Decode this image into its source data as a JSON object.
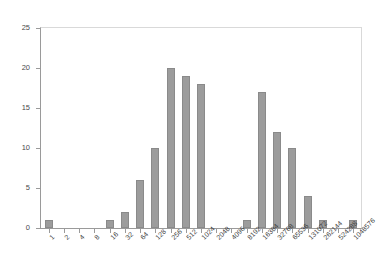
{
  "chart_data": {
    "type": "bar",
    "title": "",
    "subtitle": "",
    "xlabel": "",
    "ylabel": "",
    "ylim": [
      0,
      25
    ],
    "ytick_step": 5,
    "yticks": [
      "0",
      "5",
      "10",
      "15",
      "20",
      "25"
    ],
    "grid": false,
    "legend": false,
    "legend_position": "none",
    "bar_color": "#9c9c9c",
    "bar_border_color": "#8a8a8a",
    "axis_color": "#9a9a9a",
    "plot_border_color": "#d9d9d9",
    "categories": [
      "1",
      "2",
      "4",
      "8",
      "16",
      "32",
      "64",
      "128",
      "256",
      "512",
      "1024",
      "2048",
      "4096",
      "8192",
      "16384",
      "32768",
      "65536",
      "131072",
      "262144",
      "524288",
      "1048576"
    ],
    "values": [
      1,
      0,
      0,
      0,
      1,
      2,
      6,
      10,
      20,
      19,
      18,
      0,
      0,
      1,
      17,
      12,
      10,
      4,
      1,
      0,
      1
    ],
    "xlabel_rotation": -45
  }
}
